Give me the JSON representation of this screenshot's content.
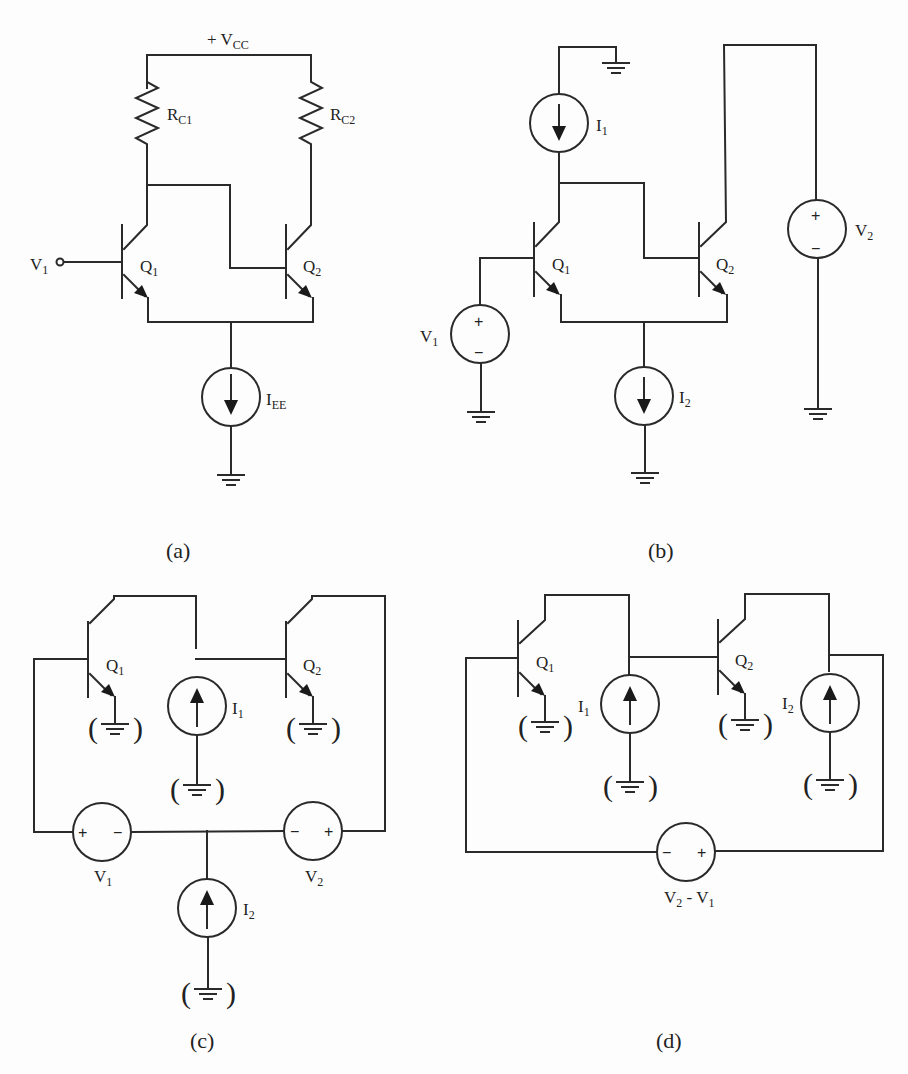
{
  "figure": {
    "panels": [
      {
        "id": "a",
        "caption": "(a)",
        "labels": {
          "supply": "+ V",
          "supply_sub": "CC",
          "rc1": "R",
          "rc1_sub": "C1",
          "rc2": "R",
          "rc2_sub": "C2",
          "input": "V",
          "input_sub": "1",
          "q1": "Q",
          "q1_sub": "1",
          "q2": "Q",
          "q2_sub": "2",
          "iee": "I",
          "iee_sub": "EE"
        }
      },
      {
        "id": "b",
        "caption": "(b)",
        "labels": {
          "i1": "I",
          "i1_sub": "1",
          "i2": "I",
          "i2_sub": "2",
          "v1": "V",
          "v1_sub": "1",
          "v2": "V",
          "v2_sub": "2",
          "q1": "Q",
          "q1_sub": "1",
          "q2": "Q",
          "q2_sub": "2",
          "plus": "+",
          "minus": "−"
        }
      },
      {
        "id": "c",
        "caption": "(c)",
        "labels": {
          "q1": "Q",
          "q1_sub": "1",
          "q2": "Q",
          "q2_sub": "2",
          "i1": "I",
          "i1_sub": "1",
          "i2": "I",
          "i2_sub": "2",
          "v1": "V",
          "v1_sub": "1",
          "v2": "V",
          "v2_sub": "2",
          "plus": "+",
          "minus": "−",
          "paren_open": "(",
          "paren_close": ")"
        }
      },
      {
        "id": "d",
        "caption": "(d)",
        "labels": {
          "q1": "Q",
          "q1_sub": "1",
          "q2": "Q",
          "q2_sub": "2",
          "i1": "I",
          "i1_sub": "1",
          "i2": "I",
          "i2_sub": "2",
          "vdiff_a": "V",
          "vdiff_a_sub": "2",
          "vdiff_mid": " - V",
          "vdiff_b_sub": "1",
          "plus": "+",
          "minus": "−",
          "paren_open": "(",
          "paren_close": ")"
        }
      }
    ]
  }
}
